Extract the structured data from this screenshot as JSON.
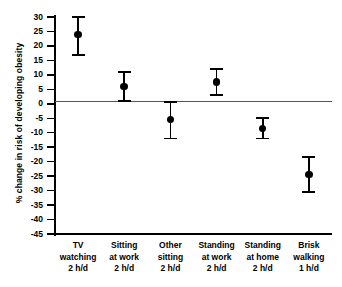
{
  "chart_data": {
    "type": "scatter",
    "title": "",
    "xlabel": "",
    "ylabel": "% change in risk of developing obesity",
    "ylim": [
      -45,
      30
    ],
    "ytick_step": 5,
    "yticks": [
      "30",
      "25",
      "20",
      "15",
      "10",
      "5",
      "0",
      "-5",
      "-10",
      "-15",
      "-20",
      "-25",
      "-30",
      "-35",
      "-40",
      "-45"
    ],
    "grid": false,
    "legend": "none",
    "zero_reference_line": true,
    "error_bar_type": "95% confidence interval",
    "categories": [
      "TV watching 2 h/d",
      "Sitting at work 2 h/d",
      "Other sitting 2 h/d",
      "Standing at work 2 h/d",
      "Standing at home 2 h/d",
      "Brisk walking 1 h/d"
    ],
    "category_lines": [
      [
        "TV",
        "watching",
        "2 h/d"
      ],
      [
        "Sitting",
        "at work",
        "2 h/d"
      ],
      [
        "Other",
        "sitting",
        "2 h/d"
      ],
      [
        "Standing",
        "at work",
        "2 h/d"
      ],
      [
        "Standing",
        "at home",
        "2 h/d"
      ],
      [
        "Brisk",
        "walking",
        "1 h/d"
      ]
    ],
    "values": [
      24,
      6,
      -5.5,
      7.5,
      -8.5,
      -24.5
    ],
    "ci_low": [
      17,
      1,
      -12,
      3,
      -12,
      -30.5
    ],
    "ci_high": [
      30,
      11,
      0.5,
      12,
      -5,
      -18.5
    ],
    "colors": {
      "marker": "#000000",
      "error_bar": "#000000",
      "axis": "#000000",
      "zero_line": "#555555",
      "background": "#ffffff"
    }
  }
}
